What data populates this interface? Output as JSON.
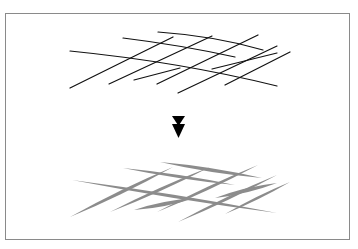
{
  "diagram": {
    "colors": {
      "frame": "#8a8a8a",
      "input_stroke": "#111111",
      "output_stroke": "#8c8c8c",
      "arrow": "#000000",
      "background": "#ffffff"
    },
    "input_lines": [
      {
        "d": "M70,51 Q180,62 277,86"
      },
      {
        "d": "M123,38 Q180,45 235,57"
      },
      {
        "d": "M158,32 Q215,36 263,50"
      },
      {
        "d": "M70,88 L173,37"
      },
      {
        "d": "M109,84 L212,36"
      },
      {
        "d": "M157,84 L258,35"
      },
      {
        "d": "M178,93 L277,46"
      },
      {
        "d": "M225,85 L290,52"
      },
      {
        "d": "M134,80 L180,68"
      },
      {
        "d": "M212,69 L277,53"
      }
    ],
    "output_strokes": [
      {
        "x1": 72,
        "y1": 180,
        "x2": 277,
        "y2": 213,
        "w": 3.2
      },
      {
        "x1": 123,
        "y1": 168,
        "x2": 235,
        "y2": 185,
        "w": 3
      },
      {
        "x1": 160,
        "y1": 162,
        "x2": 262,
        "y2": 178,
        "w": 3.6
      },
      {
        "x1": 70,
        "y1": 217,
        "x2": 173,
        "y2": 167,
        "w": 3.4
      },
      {
        "x1": 110,
        "y1": 212,
        "x2": 210,
        "y2": 167,
        "w": 3
      },
      {
        "x1": 157,
        "y1": 212,
        "x2": 258,
        "y2": 165,
        "w": 3
      },
      {
        "x1": 178,
        "y1": 222,
        "x2": 277,
        "y2": 175,
        "w": 3
      },
      {
        "x1": 225,
        "y1": 214,
        "x2": 290,
        "y2": 182,
        "w": 2.6
      },
      {
        "x1": 134,
        "y1": 210,
        "x2": 195,
        "y2": 198,
        "w": 4
      },
      {
        "x1": 215,
        "y1": 198,
        "x2": 277,
        "y2": 183,
        "w": 4
      }
    ],
    "arrow": {
      "icon": "double-down-arrow-icon"
    }
  }
}
